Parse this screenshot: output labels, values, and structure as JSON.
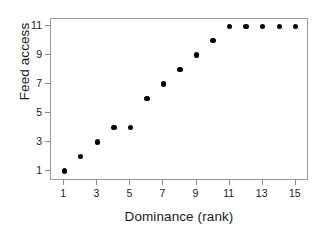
{
  "chart_data": {
    "type": "scatter",
    "title": "",
    "xlabel": "Dominance (rank)",
    "ylabel": "Feed access",
    "x": [
      1,
      2,
      3,
      4,
      5,
      6,
      7,
      8,
      9,
      10,
      11,
      12,
      13,
      14,
      15
    ],
    "values": [
      1,
      2,
      3,
      4,
      4,
      6,
      7,
      8,
      9,
      10,
      11,
      11,
      11,
      11,
      11
    ],
    "series": [
      {
        "name": "Feed access by dominance rank",
        "values": [
          1,
          2,
          3,
          4,
          4,
          6,
          7,
          8,
          9,
          10,
          11,
          11,
          11,
          11,
          11
        ]
      }
    ],
    "xlim": [
      0.2,
      15.8
    ],
    "ylim": [
      0.3,
      11.5
    ],
    "xticks": [
      1,
      3,
      5,
      7,
      9,
      11,
      13,
      15
    ],
    "xticklabels": [
      "1",
      "3",
      "5",
      "7",
      "9",
      "11",
      "13",
      "15"
    ],
    "yticks": [
      1,
      3,
      5,
      7,
      9,
      11
    ],
    "yticklabels": [
      "1",
      "3",
      "5",
      "7",
      "9",
      "11"
    ],
    "grid": false,
    "legend": false,
    "marker": "filled-circle",
    "marker_color": "#000000",
    "frame_color": "#9a9a9a",
    "background": "#ffffff"
  }
}
